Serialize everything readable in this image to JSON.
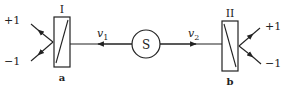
{
  "diagram": {
    "source": {
      "label": "S"
    },
    "analyzers": [
      {
        "roman": "I",
        "letter": "a",
        "outputs": [
          "+1",
          "−1"
        ]
      },
      {
        "roman": "II",
        "letter": "b",
        "outputs": [
          "+1",
          "−1"
        ]
      }
    ],
    "beams": [
      {
        "label": "v",
        "subscript": "1",
        "direction": "left"
      },
      {
        "label": "v",
        "subscript": "2",
        "direction": "right"
      }
    ],
    "colors": {
      "ink": "#222222",
      "background": "#ffffff"
    }
  }
}
